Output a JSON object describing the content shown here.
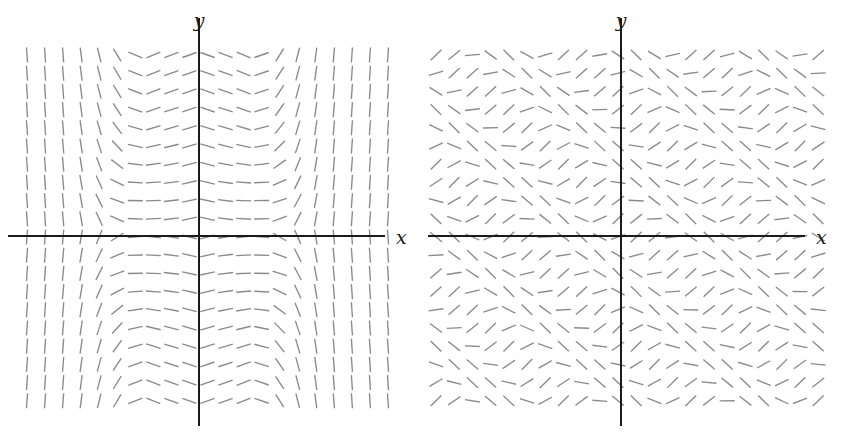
{
  "figure": {
    "kind": "slope-field-pair",
    "background_color": "#ffffff",
    "stroke_color": "#8a8a8a",
    "axis_color": "#1a1a1a",
    "panel_count": 2
  },
  "panels": [
    {
      "id": "left",
      "name": "slope-field-left",
      "axis_labels": {
        "x": "x",
        "y": "y"
      },
      "origin": {
        "x": 199,
        "y": 236
      },
      "axis_extent": {
        "x_min": 8,
        "x_max": 385,
        "y_min": 18,
        "y_max": 426
      },
      "x_label_pos": {
        "x": 396,
        "y": 237
      },
      "y_label_pos": {
        "x": 199,
        "y": 30
      },
      "grid": {
        "x0": 27,
        "y0": 55,
        "step_x": 18.05,
        "step_y": 18.2,
        "cols": 21,
        "rows": 20
      },
      "dash_length": 15,
      "equation": "dy/dx = (x^2 - 1) * f(y)",
      "symmetry": "even in y, odd-banded in x"
    },
    {
      "id": "right",
      "name": "slope-field-right",
      "axis_labels": {
        "x": "x",
        "y": "y"
      },
      "origin": {
        "x": 201,
        "y": 236
      },
      "axis_extent": {
        "x_min": 8,
        "x_max": 385,
        "y_min": 18,
        "y_max": 426
      },
      "x_label_pos": {
        "x": 396,
        "y": 237
      },
      "y_label_pos": {
        "x": 201,
        "y": 30
      },
      "grid": {
        "x0": 16,
        "y0": 55,
        "step_x": 18.2,
        "step_y": 18.2,
        "cols": 22,
        "rows": 20
      },
      "dash_length": 15,
      "equation": "dy/dx = sin(x + y)",
      "symmetry": "diagonal travelling wave"
    }
  ],
  "chart_data": {
    "type": "line",
    "title": "",
    "xlabel": "x",
    "ylabel": "y",
    "subplots": [
      {
        "name": "left",
        "plot_type": "slope-field",
        "description": "Direction field with nearly vertical dashes near the left and right edges, flattening to horizontal dashes in two lobes on either side of the y-axis; symmetric about the x-axis.",
        "xlim": [
          -10.5,
          10.5
        ],
        "ylim": [
          -10.5,
          10.5
        ],
        "grid": false,
        "axis_ticks": false,
        "slope_rule": "slope ~ tanh-like in x times cosine envelope in y; large |slope| at extreme x, slope ~ 0 in the interior lobes"
      },
      {
        "name": "right",
        "plot_type": "slope-field",
        "description": "Direction field of dy/dx = sin(x+y): dashes rotate smoothly along diagonal bands running from upper-left to lower-right, repeating periodically.",
        "xlim": [
          -10.5,
          10.5
        ],
        "ylim": [
          -10.5,
          10.5
        ],
        "grid": false,
        "axis_ticks": false,
        "slope_rule": "slope = sin(x + y)"
      }
    ]
  }
}
